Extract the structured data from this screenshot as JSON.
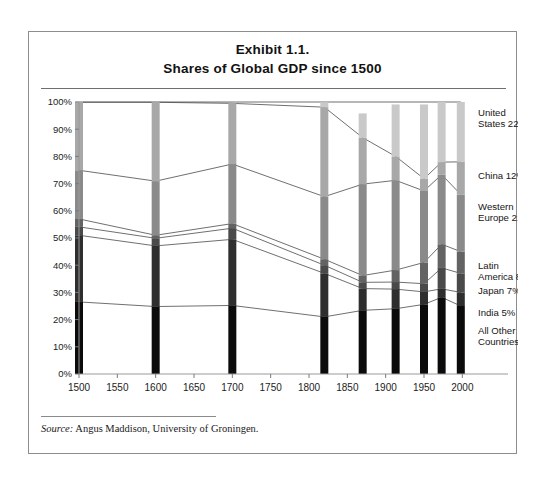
{
  "figure": {
    "title_line1": "Exhibit 1.1.",
    "title_line2": "Shares of Global GDP since 1500",
    "source_label": "Source:",
    "source_text": " Angus Maddison, University of Groningen."
  },
  "chart_data": {
    "type": "area",
    "title": "Shares of Global GDP since 1500",
    "xlabel": "",
    "ylabel": "",
    "xlim": [
      1500,
      2010
    ],
    "ylim": [
      0,
      100
    ],
    "grid": false,
    "legend_position": "right",
    "axis": {
      "x_ticks": [
        1500,
        1550,
        1600,
        1650,
        1700,
        1750,
        1800,
        1850,
        1900,
        1950,
        2000
      ],
      "y_ticks": [
        "0%",
        "10%",
        "20%",
        "30%",
        "40%",
        "50%",
        "60%",
        "70%",
        "80%",
        "90%",
        "100%"
      ],
      "y_tick_values": [
        0,
        10,
        20,
        30,
        40,
        50,
        60,
        70,
        80,
        90,
        100
      ]
    },
    "x": [
      1500,
      1600,
      1700,
      1820,
      1870,
      1913,
      1950,
      1973,
      1998
    ],
    "bar_years": [
      1500,
      1600,
      1700,
      1820,
      1870,
      1913,
      1950,
      1973,
      1998
    ],
    "stack_order_bottom_to_top": [
      "All Other Countries",
      "India",
      "Japan",
      "Latin America",
      "Western Europe",
      "China",
      "United States"
    ],
    "series": [
      {
        "name": "All Other Countries",
        "legend_label": "All Other Countries 25%",
        "final_share": 25,
        "color": "#0b0b0b",
        "values": [
          26.5,
          24.8,
          25.2,
          21.0,
          23.4,
          24.0,
          25.6,
          28.2,
          25.0
        ]
      },
      {
        "name": "India",
        "legend_label": "India 5%",
        "final_share": 5,
        "color": "#2e2e2e",
        "values": [
          24.5,
          22.3,
          24.3,
          16.0,
          8.0,
          7.2,
          4.6,
          3.1,
          5.0
        ]
      },
      {
        "name": "Japan",
        "legend_label": "Japan 7%",
        "final_share": 7,
        "color": "#4a4a4a",
        "values": [
          3.1,
          2.8,
          4.1,
          3.0,
          2.3,
          2.6,
          3.0,
          7.7,
          7.0
        ]
      },
      {
        "name": "Latin America",
        "legend_label": "Latin America 8%",
        "final_share": 8,
        "color": "#636363",
        "values": [
          2.9,
          1.1,
          1.7,
          2.2,
          2.5,
          4.4,
          7.8,
          8.7,
          8.0
        ]
      },
      {
        "name": "Western Europe",
        "legend_label": "Western Europe 21%",
        "final_share": 21,
        "color": "#8a8a8a",
        "values": [
          17.9,
          19.9,
          21.9,
          23.0,
          33.6,
          33.0,
          26.3,
          25.6,
          21.0
        ]
      },
      {
        "name": "China",
        "legend_label": "China 12%",
        "final_share": 12,
        "color": "#a8a8a8",
        "values": [
          25.0,
          29.0,
          22.3,
          32.9,
          17.1,
          8.8,
          4.5,
          4.6,
          12.0
        ]
      },
      {
        "name": "United States",
        "legend_label": "United States 22%",
        "final_share": 22,
        "color": "#c9c9c9",
        "values": [
          0.3,
          0.2,
          0.1,
          1.8,
          8.9,
          19.1,
          27.3,
          22.1,
          22.0
        ]
      }
    ],
    "legend": [
      {
        "label_line1": "United",
        "label_line2": "States 22%",
        "value": 22,
        "color": "#c9c9c9"
      },
      {
        "label_line1": "China 12%",
        "label_line2": "",
        "value": 12,
        "color": "#a8a8a8"
      },
      {
        "label_line1": "Western",
        "label_line2": "Europe 21%",
        "value": 21,
        "color": "#8a8a8a"
      },
      {
        "label_line1": "Latin",
        "label_line2": "America 8%",
        "value": 8,
        "color": "#636363"
      },
      {
        "label_line1": "Japan 7%",
        "label_line2": "",
        "value": 7,
        "color": "#4a4a4a"
      },
      {
        "label_line1": "India 5%",
        "label_line2": "",
        "value": 5,
        "color": "#2e2e2e"
      },
      {
        "label_line1": "All Other",
        "label_line2": "Countries 25%",
        "value": 25,
        "color": "#0b0b0b"
      }
    ]
  }
}
